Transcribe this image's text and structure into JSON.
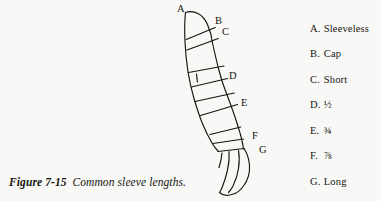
{
  "figure": {
    "caption_figure_number": "Figure 7-15",
    "caption_text": "Common sleeve lengths.",
    "background_color": "#f8f8f7",
    "ink_color": "#17150f"
  },
  "illustration": {
    "description": "line drawing of an arm with a sleeve marked at seven lengths",
    "callouts": [
      {
        "key": "A",
        "x": 177,
        "y": 4
      },
      {
        "key": "B",
        "x": 215,
        "y": 16
      },
      {
        "key": "C",
        "x": 222,
        "y": 27
      },
      {
        "key": "D",
        "x": 229,
        "y": 71
      },
      {
        "key": "E",
        "x": 241,
        "y": 98
      },
      {
        "key": "F",
        "x": 252,
        "y": 131
      },
      {
        "key": "G",
        "x": 259,
        "y": 145
      }
    ]
  },
  "legend": {
    "items": [
      {
        "key": "A.",
        "label": "Sleeveless",
        "y": 24
      },
      {
        "key": "B.",
        "label": "Cap",
        "y": 49
      },
      {
        "key": "C.",
        "label": "Short",
        "y": 75
      },
      {
        "key": "D.",
        "label": "½",
        "y": 100
      },
      {
        "key": "E.",
        "label": "¾",
        "y": 126
      },
      {
        "key": "F.",
        "label": "⅞",
        "y": 151
      },
      {
        "key": "G.",
        "label": "Long",
        "y": 177
      }
    ]
  }
}
